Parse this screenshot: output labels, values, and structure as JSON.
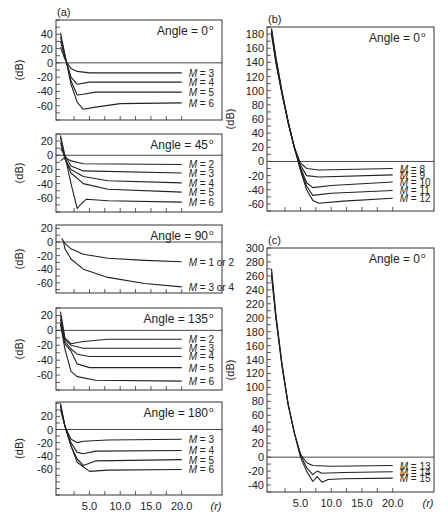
{
  "chart_data": [
    {
      "type": "line",
      "panel_label": "(a)",
      "title": "Angle = 0°",
      "angle_text": "Angle = 0",
      "ylabel": "(dB)",
      "xlabel": "(r)",
      "frame": [
        56,
        20,
        222,
        120
      ],
      "ylim": [
        -80,
        60
      ],
      "xlim": [
        0,
        26.5
      ],
      "yticks": [
        40,
        20,
        0,
        -20,
        -40,
        -60
      ],
      "series": [
        {
          "name": "M = 3",
          "points": [
            [
              0.3,
              22
            ],
            [
              1,
              5
            ],
            [
              2,
              -8
            ],
            [
              3,
              -12
            ],
            [
              5,
              -14
            ],
            [
              20,
              -14
            ]
          ]
        },
        {
          "name": "M = 4",
          "points": [
            [
              0.3,
              30
            ],
            [
              1,
              8
            ],
            [
              2,
              -20
            ],
            [
              3,
              -30
            ],
            [
              5,
              -27
            ],
            [
              20,
              -27
            ]
          ]
        },
        {
          "name": "M = 5",
          "points": [
            [
              0.3,
              36
            ],
            [
              1,
              10
            ],
            [
              2,
              -25
            ],
            [
              3,
              -45
            ],
            [
              4,
              -44
            ],
            [
              6,
              -41
            ],
            [
              20,
              -41
            ]
          ]
        },
        {
          "name": "M = 6",
          "points": [
            [
              0.3,
              42
            ],
            [
              1,
              12
            ],
            [
              2,
              -30
            ],
            [
              3,
              -55
            ],
            [
              4,
              -65
            ],
            [
              6,
              -62
            ],
            [
              10,
              -57
            ],
            [
              20,
              -56
            ]
          ]
        }
      ]
    },
    {
      "type": "line",
      "panel_label": "",
      "title": "Angle = 45°",
      "angle_text": "Angle = 45",
      "ylabel": "(dB)",
      "frame": [
        56,
        134,
        222,
        212
      ],
      "ylim": [
        -80,
        30
      ],
      "xlim": [
        0,
        26.5
      ],
      "yticks": [
        20,
        0,
        -20,
        -40,
        -60
      ],
      "series": [
        {
          "name": "M = 2",
          "points": [
            [
              0.3,
              -8
            ],
            [
              1,
              -3
            ],
            [
              2,
              -8
            ],
            [
              4,
              -12
            ],
            [
              20,
              -13
            ]
          ]
        },
        {
          "name": "M = 3",
          "points": [
            [
              0.3,
              10
            ],
            [
              1,
              0
            ],
            [
              2,
              -15
            ],
            [
              4,
              -22
            ],
            [
              20,
              -25
            ]
          ]
        },
        {
          "name": "M = 4",
          "points": [
            [
              0.3,
              18
            ],
            [
              1,
              -5
            ],
            [
              2,
              -20
            ],
            [
              4,
              -30
            ],
            [
              8,
              -36
            ],
            [
              20,
              -39
            ]
          ]
        },
        {
          "name": "M = 5",
          "points": [
            [
              0.3,
              25
            ],
            [
              1,
              -5
            ],
            [
              2,
              -25
            ],
            [
              4,
              -40
            ],
            [
              8,
              -48
            ],
            [
              20,
              -52
            ]
          ]
        },
        {
          "name": "M = 6",
          "points": [
            [
              0.3,
              28
            ],
            [
              1,
              0
            ],
            [
              2,
              -40
            ],
            [
              3,
              -75
            ],
            [
              3.5,
              -70
            ],
            [
              4.5,
              -62
            ],
            [
              8,
              -64
            ],
            [
              20,
              -66
            ]
          ]
        }
      ]
    },
    {
      "type": "line",
      "panel_label": "",
      "title": "Angle = 90°",
      "angle_text": "Angle = 90",
      "ylabel": "(dB)",
      "frame": [
        56,
        225,
        222,
        293
      ],
      "ylim": [
        -75,
        25
      ],
      "xlim": [
        0,
        26.5
      ],
      "yticks": [
        20,
        0,
        -20,
        -40,
        -60
      ],
      "series": [
        {
          "name": "M = 1 or 2",
          "points": [
            [
              0.5,
              5
            ],
            [
              1,
              -2
            ],
            [
              2,
              -10
            ],
            [
              4,
              -18
            ],
            [
              8,
              -24
            ],
            [
              14,
              -27
            ],
            [
              20,
              -29
            ]
          ]
        },
        {
          "name": "M = 3 or 4",
          "points": [
            [
              0.8,
              0
            ],
            [
              1,
              -10
            ],
            [
              2,
              -25
            ],
            [
              4,
              -40
            ],
            [
              8,
              -52
            ],
            [
              14,
              -61
            ],
            [
              20,
              -66
            ]
          ]
        }
      ]
    },
    {
      "type": "line",
      "panel_label": "",
      "title": "Angle = 135°",
      "angle_text": "Angle = 135",
      "ylabel": "(dB)",
      "frame": [
        56,
        308,
        222,
        390
      ],
      "ylim": [
        -80,
        30
      ],
      "xlim": [
        0,
        26.5
      ],
      "yticks": [
        20,
        0,
        -20,
        -40,
        -60
      ],
      "series": [
        {
          "name": "M = 2",
          "points": [
            [
              0.3,
              25
            ],
            [
              1,
              -10
            ],
            [
              2,
              -18
            ],
            [
              4,
              -15
            ],
            [
              8,
              -12
            ],
            [
              20,
              -12
            ]
          ]
        },
        {
          "name": "M = 3",
          "points": [
            [
              0.3,
              20
            ],
            [
              1,
              -12
            ],
            [
              2,
              -20
            ],
            [
              4,
              -24
            ],
            [
              20,
              -24
            ]
          ]
        },
        {
          "name": "M = 4",
          "points": [
            [
              0.3,
              15
            ],
            [
              1,
              -15
            ],
            [
              2,
              -25
            ],
            [
              3,
              -32
            ],
            [
              5,
              -35
            ],
            [
              20,
              -35
            ]
          ]
        },
        {
          "name": "M = 5",
          "points": [
            [
              0.3,
              10
            ],
            [
              1,
              -18
            ],
            [
              2,
              -28
            ],
            [
              3,
              -45
            ],
            [
              5,
              -50
            ],
            [
              20,
              -50
            ]
          ]
        },
        {
          "name": "M = 6",
          "points": [
            [
              0.3,
              8
            ],
            [
              1,
              -25
            ],
            [
              2,
              -55
            ],
            [
              3,
              -62
            ],
            [
              6,
              -67
            ],
            [
              20,
              -68
            ]
          ]
        }
      ]
    },
    {
      "type": "line",
      "panel_label": "",
      "title": "Angle = 180°",
      "angle_text": "Angle = 180",
      "ylabel": "(dB)",
      "xlabel": "(r)",
      "frame": [
        56,
        402,
        222,
        495
      ],
      "ylim": [
        -100,
        42
      ],
      "xlim": [
        0,
        26.5
      ],
      "yticks": [
        20,
        0,
        -20,
        -40,
        -60
      ],
      "xticks": [
        5.0,
        10.0,
        15.0,
        20.0
      ],
      "xtick_labels": [
        "5.0",
        "10.0",
        "15.0",
        "20.0"
      ],
      "series": [
        {
          "name": "M = 3",
          "points": [
            [
              0.3,
              30
            ],
            [
              1,
              5
            ],
            [
              2,
              -15
            ],
            [
              3,
              -20
            ],
            [
              4,
              -18
            ],
            [
              8,
              -16
            ],
            [
              20,
              -15
            ]
          ]
        },
        {
          "name": "M = 4",
          "points": [
            [
              0.3,
              35
            ],
            [
              1,
              5
            ],
            [
              2,
              -20
            ],
            [
              3,
              -35
            ],
            [
              4,
              -37
            ],
            [
              6,
              -33
            ],
            [
              20,
              -32
            ]
          ]
        },
        {
          "name": "M = 5",
          "points": [
            [
              0.3,
              38
            ],
            [
              1,
              5
            ],
            [
              2,
              -25
            ],
            [
              3,
              -45
            ],
            [
              4,
              -55
            ],
            [
              6,
              -48
            ],
            [
              20,
              -46
            ]
          ]
        },
        {
          "name": "M = 6",
          "points": [
            [
              0.3,
              40
            ],
            [
              1,
              5
            ],
            [
              2,
              -25
            ],
            [
              3,
              -50
            ],
            [
              5,
              -64
            ],
            [
              8,
              -62
            ],
            [
              20,
              -61
            ]
          ]
        }
      ]
    },
    {
      "type": "line",
      "panel_label": "(b)",
      "title": "Angle = 0°",
      "angle_text": "Angle = 0",
      "ylabel": "(dB)",
      "frame": [
        267,
        27,
        434,
        211
      ],
      "ylim": [
        -70,
        190
      ],
      "xlim": [
        0,
        26.5
      ],
      "yticks": [
        180,
        160,
        140,
        120,
        100,
        80,
        60,
        40,
        20,
        0,
        -20,
        -40,
        -60
      ],
      "series": [
        {
          "name": "M = 8",
          "points": [
            [
              0.3,
              180
            ],
            [
              1,
              140
            ],
            [
              2,
              95
            ],
            [
              3,
              55
            ],
            [
              4,
              20
            ],
            [
              5,
              -2
            ],
            [
              6,
              -10
            ],
            [
              8,
              -12
            ],
            [
              20,
              -10
            ]
          ]
        },
        {
          "name": "M = 9",
          "points": [
            [
              0.3,
              182
            ],
            [
              1,
              142
            ],
            [
              2,
              96
            ],
            [
              3,
              55
            ],
            [
              4,
              20
            ],
            [
              5,
              -5
            ],
            [
              6,
              -20
            ],
            [
              8,
              -22
            ],
            [
              20,
              -19
            ]
          ]
        },
        {
          "name": "M = 10",
          "points": [
            [
              0.3,
              184
            ],
            [
              1,
              144
            ],
            [
              2,
              97
            ],
            [
              3,
              56
            ],
            [
              4,
              20
            ],
            [
              5,
              -8
            ],
            [
              6,
              -30
            ],
            [
              7,
              -37
            ],
            [
              10,
              -34
            ],
            [
              20,
              -29
            ]
          ]
        },
        {
          "name": "M = 11",
          "points": [
            [
              0.3,
              186
            ],
            [
              1,
              146
            ],
            [
              2,
              98
            ],
            [
              3,
              56
            ],
            [
              4,
              20
            ],
            [
              5,
              -10
            ],
            [
              6,
              -35
            ],
            [
              7,
              -48
            ],
            [
              10,
              -45
            ],
            [
              20,
              -41
            ]
          ]
        },
        {
          "name": "M = 12",
          "points": [
            [
              0.3,
              188
            ],
            [
              1,
              148
            ],
            [
              2,
              99
            ],
            [
              3,
              57
            ],
            [
              4,
              20
            ],
            [
              5,
              -12
            ],
            [
              6,
              -40
            ],
            [
              7,
              -55
            ],
            [
              8,
              -59
            ],
            [
              12,
              -56
            ],
            [
              20,
              -52
            ]
          ]
        }
      ]
    },
    {
      "type": "line",
      "panel_label": "(c)",
      "title": "Angle = 0°",
      "angle_text": "Angle = 0",
      "ylabel": "(dB)",
      "xlabel": "(r)",
      "frame": [
        267,
        248,
        434,
        492
      ],
      "ylim": [
        -50,
        300
      ],
      "xlim": [
        0,
        26.5
      ],
      "yticks": [
        300,
        280,
        260,
        240,
        220,
        200,
        180,
        160,
        140,
        120,
        100,
        80,
        60,
        40,
        20,
        0,
        -20,
        -40
      ],
      "xticks": [
        5.0,
        10.0,
        15.0,
        20.0
      ],
      "xtick_labels": [
        "5.0",
        "10.0",
        "15.0",
        "20.0"
      ],
      "series": [
        {
          "name": "M = 13",
          "points": [
            [
              0.3,
              260
            ],
            [
              1,
              200
            ],
            [
              2,
              130
            ],
            [
              3,
              75
            ],
            [
              4,
              35
            ],
            [
              5,
              5
            ],
            [
              6,
              -8
            ],
            [
              7,
              -12
            ],
            [
              10,
              -13
            ],
            [
              20,
              -12
            ]
          ]
        },
        {
          "name": "M = 14",
          "points": [
            [
              0.3,
              265
            ],
            [
              1,
              203
            ],
            [
              2,
              132
            ],
            [
              3,
              76
            ],
            [
              4,
              35
            ],
            [
              5,
              3
            ],
            [
              6,
              -15
            ],
            [
              7,
              -25
            ],
            [
              7.7,
              -20
            ],
            [
              8.5,
              -23
            ],
            [
              12,
              -22
            ],
            [
              20,
              -21
            ]
          ]
        },
        {
          "name": "M = 15",
          "points": [
            [
              0.3,
              270
            ],
            [
              1,
              206
            ],
            [
              2,
              134
            ],
            [
              3,
              77
            ],
            [
              4,
              35
            ],
            [
              5,
              0
            ],
            [
              6,
              -20
            ],
            [
              7,
              -35
            ],
            [
              7.7,
              -28
            ],
            [
              8.5,
              -36
            ],
            [
              9.5,
              -32
            ],
            [
              12,
              -31
            ],
            [
              20,
              -30
            ]
          ]
        }
      ]
    }
  ]
}
